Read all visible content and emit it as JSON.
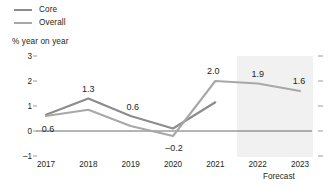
{
  "chart_data": {
    "type": "line",
    "title": "",
    "ylabel": "% year on year",
    "xlabel": "",
    "categories": [
      "2017",
      "2018",
      "2019",
      "2020",
      "2021",
      "2022",
      "2023"
    ],
    "ylim": [
      -1,
      3
    ],
    "yticks": [
      "3",
      "2",
      "1",
      "0",
      "-1"
    ],
    "grid": false,
    "legend_position": "top-left",
    "series": [
      {
        "name": "Core",
        "color": "#8c8c8c",
        "values": [
          0.65,
          1.3,
          0.6,
          0.1,
          1.15,
          null,
          null
        ]
      },
      {
        "name": "Overall",
        "color": "#a8a8a8",
        "values": [
          0.6,
          0.85,
          0.2,
          -0.2,
          2.0,
          1.9,
          1.6
        ]
      }
    ],
    "annotations": [
      {
        "text": "0.6",
        "x": "2017",
        "y": 0.6,
        "dx": 2,
        "dy": 13
      },
      {
        "text": "1.3",
        "x": "2018",
        "y": 1.3,
        "dx": 0,
        "dy": -10
      },
      {
        "text": "0.6",
        "x": "2019",
        "y": 0.6,
        "dx": 2,
        "dy": -9
      },
      {
        "text": "-0.2",
        "x": "2020",
        "y": -0.2,
        "dx": 1,
        "dy": 12
      },
      {
        "text": "2.0",
        "x": "2021",
        "y": 2.0,
        "dx": -2,
        "dy": -10
      },
      {
        "text": "1.9",
        "x": "2022",
        "y": 1.9,
        "dx": 0,
        "dy": -10
      },
      {
        "text": "1.6",
        "x": "2023",
        "y": 1.6,
        "dx": -1,
        "dy": -10
      }
    ],
    "forecast": {
      "label": "Forecast",
      "start_category": "2021",
      "end_category": "2023",
      "band_color": "#f1f1f1"
    },
    "zero_line_color": "#58595b",
    "tick_color": "#9b9b9b"
  }
}
